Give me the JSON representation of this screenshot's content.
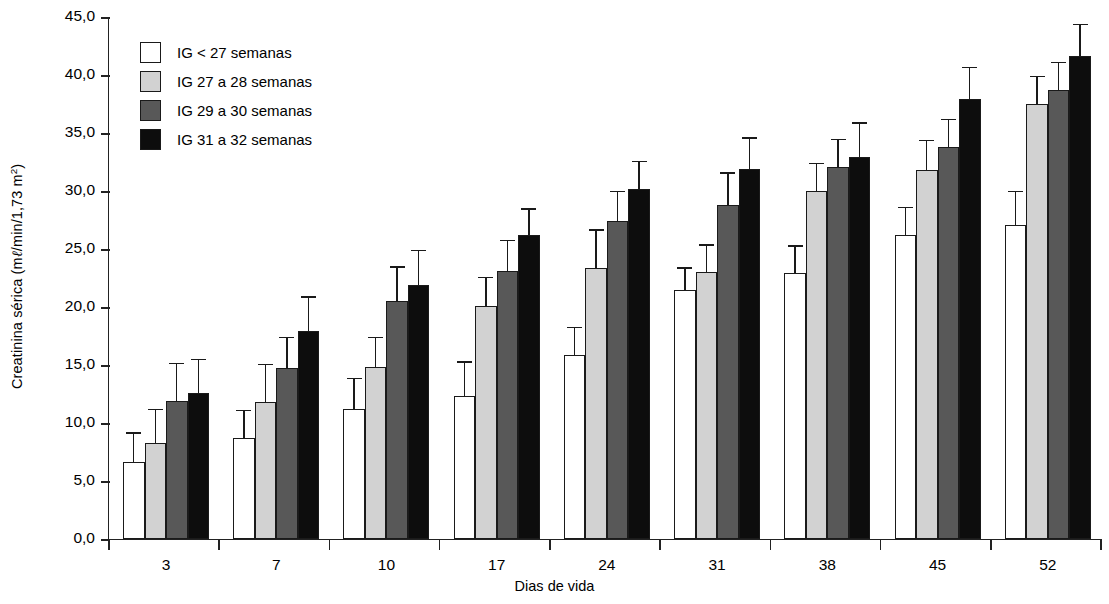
{
  "chart_data": {
    "type": "bar",
    "title": "",
    "xlabel": "Dias de vida",
    "ylabel": "Creatinina sérica (mℓ/min/1,73 m²)",
    "categories": [
      "3",
      "7",
      "10",
      "17",
      "24",
      "31",
      "38",
      "45",
      "52"
    ],
    "ylim": [
      0,
      45
    ],
    "ytick_values": [
      0,
      5,
      10,
      15,
      20,
      25,
      30,
      35,
      40,
      45
    ],
    "ytick_labels": [
      "0,0",
      "5,0",
      "10,0",
      "15,0",
      "20,0",
      "25,0",
      "30,0",
      "35,0",
      "40,0",
      "45,0"
    ],
    "grid": false,
    "legend_position": "upper-left-inside",
    "error_bars": "upper only (SD)",
    "series": [
      {
        "name": "IG < 27 semanas",
        "color": "#ffffff",
        "values": [
          6.6,
          8.7,
          11.2,
          12.3,
          15.9,
          21.5,
          22.9,
          26.2,
          27.1
        ],
        "errors_upper": [
          9.3,
          11.2,
          14.0,
          15.4,
          18.4,
          23.5,
          25.4,
          28.7,
          30.1
        ]
      },
      {
        "name": "IG 27 a 28 semanas",
        "color": "#d2d2d2",
        "values": [
          8.3,
          11.8,
          14.8,
          20.1,
          23.4,
          23.0,
          30.0,
          31.8,
          37.5
        ],
        "errors_upper": [
          11.3,
          15.2,
          17.5,
          22.7,
          26.8,
          25.5,
          32.5,
          34.5,
          40.0
        ]
      },
      {
        "name": "IG 29 a 30 semanas",
        "color": "#585858",
        "values": [
          11.9,
          14.7,
          20.5,
          23.1,
          27.4,
          28.8,
          32.1,
          33.8,
          38.7
        ],
        "errors_upper": [
          15.3,
          17.5,
          23.6,
          25.9,
          30.1,
          31.7,
          34.6,
          36.3,
          41.2
        ]
      },
      {
        "name": "IG 31 a 32 semanas",
        "color": "#0d0d0d",
        "values": [
          12.6,
          17.9,
          21.9,
          26.2,
          30.2,
          31.9,
          32.9,
          37.9,
          41.6
        ],
        "errors_upper": [
          15.6,
          21.0,
          25.0,
          28.6,
          32.7,
          34.7,
          36.0,
          40.8,
          44.5
        ]
      }
    ]
  },
  "legend": {
    "items": [
      {
        "label": "IG < 27 semanas",
        "color": "#ffffff"
      },
      {
        "label": "IG 27 a 28 semanas",
        "color": "#d2d2d2"
      },
      {
        "label": "IG 29 a 30 semanas",
        "color": "#585858"
      },
      {
        "label": "IG 31 a 32 semanas",
        "color": "#0d0d0d"
      }
    ]
  },
  "axis_titles": {
    "y": "Creatinina sérica (mℓ/min/1,73 m²)",
    "x": "Dias de vida"
  }
}
